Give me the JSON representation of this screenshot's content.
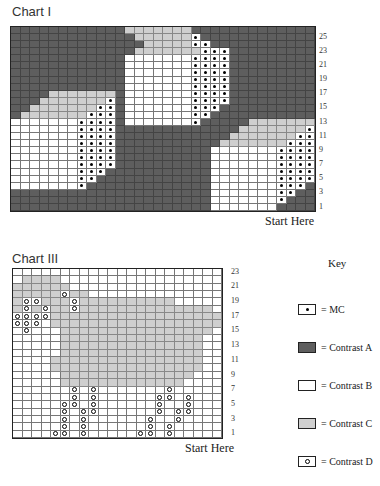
{
  "chart1": {
    "title": "Chart I",
    "start_label": "Start Here",
    "row_labels": [
      "25",
      "23",
      "21",
      "19",
      "17",
      "15",
      "13",
      "11",
      "9",
      "7",
      "5",
      "3",
      "1"
    ],
    "rows": [
      "AAAAAAAAAAAACCCCCCCAAAAAAAAAAAAA",
      "AAAAAAAAAAAAACCCCCCMAAAAAAAAAAAA",
      "AAAAAAAAAAAAAACCCCCMMAAAAAAAAAAA",
      "AAAAAAAAAAAAACCCCCCCMMMAAAAAAAAA",
      "AAAAAAAAAAAABBBBBBBMMMMAAAAAAAAA",
      "AAAAAAAAAAAABBBBBBBMMMMAAAAAAAAA",
      "AAAAAAAAAAAABBBBBBBMMMMAAAAAAAAA",
      "AAAAAAAAAAAABBBBBBBMMMMAAAAAAAAA",
      "AAAAAAAAAAAABBBBBBBMMMMAAAAAAAAA",
      "AAAACCCCCCCABBBBBBBMMMMAAAAAAAAA",
      "AAACCCCCCCMABBBBBBBMMMMAAAAAAAAA",
      "AACCCCCCCMMABBBBBBBMMMAAAAAAAAAA",
      "ACCCCCCCMMMABBBBBBBMMAAAAAAAAAAA",
      "BBBBBBBMMMMABBBBBBBMAAAAACCCCCCC",
      "BBBBBBBMMMMAAAAAAAAAAAAACCCCCCCM",
      "BBBBBBBMMMMAAAAAAAAAAAACCCCCCCMM",
      "BBBBBBBMMMMAAAAAAAAAAACCCCCCCMMM",
      "BBBBBBBMMMMAAAAAAAAAABBBBBBBMMMM",
      "BBBBBBBMMMMAAAAAAAAAABBBBBBBMMMM",
      "BBBBBBBMMMMAAAAAAAAAABBBBBBBMMMM",
      "BBBBBBBMMMAAAAAAAAAAABBBBBBBMMMM",
      "BBBBBBBMMAAAAAAAAAAAABBBBBBBMMMM",
      "BBBBBBBMAAAAAAAAAAAAABBBBBBBMMMA",
      "AAAAAAAAAAAAAAAAAAAAABBBBBBBMMAA",
      "AAAAAAAAAAAAAAAAAAAAABBBBBBBMAAA",
      "AAAAAAAAAAAAAAAAAAAAABBBBBBBAAAA"
    ]
  },
  "chart3": {
    "title": "Chart III",
    "start_label": "Start Here",
    "row_labels": [
      "23",
      "21",
      "19",
      "17",
      "15",
      "13",
      "11",
      "9",
      "7",
      "5",
      "3",
      "1"
    ],
    "rows": [
      "BBBBBBBBBBBBBBBBBBBBBB",
      "BCCCCBBBBBBBBBBBBBBBBB",
      "CCCCCCBBBBBBBBBBBBBBBB",
      "CCCCCDCCBBBBBBBBBBBBBB",
      "CDDCCCDCCCCCCCCCCBBBBB",
      "CDCDCCDCCCCCCCCCCCCCCB",
      "DDDDCCCCCCCCCCCCCCCCCC",
      "DDDBCCCCCCCCCCCCCCCCCC",
      "BDBBBCCCCCCCCCCCCCCCCB",
      "BBBBBCCCCCCCCCCCCCCCBB",
      "BBBBBCCCCCCCCCCCCCCCBB",
      "BBBBBCCCCCCCCCCCCCCCBB",
      "BBBBCCCCCCCCCCCCCCCCBB",
      "BBBBCCCCCCCCCCCCCCCCBB",
      "BBBBBCCCCCCCCCCCCCCBBB",
      "BBBBBCCCCCCCCCCCCCBBBB",
      "BBBBBBDBDBBBBBBBDBBBBB",
      "BBBBBBDBDBBBBBBDDBDBBB",
      "BBBBBDDBDBBBBBBDBBDBBB",
      "BBBBBDBDDBBBBBBDBDDBBB",
      "BBBBBDBDBBBBBBDBBDBBBB",
      "BBBBBDBDBBBBBBDBDBBBBB",
      "BBBBDDBDBBBBBDDBDBBBBB"
    ]
  },
  "key": {
    "title": "Key",
    "items": [
      {
        "code": "M",
        "label": "= MC"
      },
      {
        "code": "A",
        "label": "= Contrast A"
      },
      {
        "code": "B",
        "label": "= Contrast B"
      },
      {
        "code": "C",
        "label": "= Contrast C"
      },
      {
        "code": "D",
        "label": "= Contrast D"
      }
    ]
  },
  "colors": {
    "contrast_a": "#5e5e5e",
    "contrast_b": "#ffffff",
    "contrast_c": "#cfcfcf",
    "grid_line": "#555555"
  }
}
